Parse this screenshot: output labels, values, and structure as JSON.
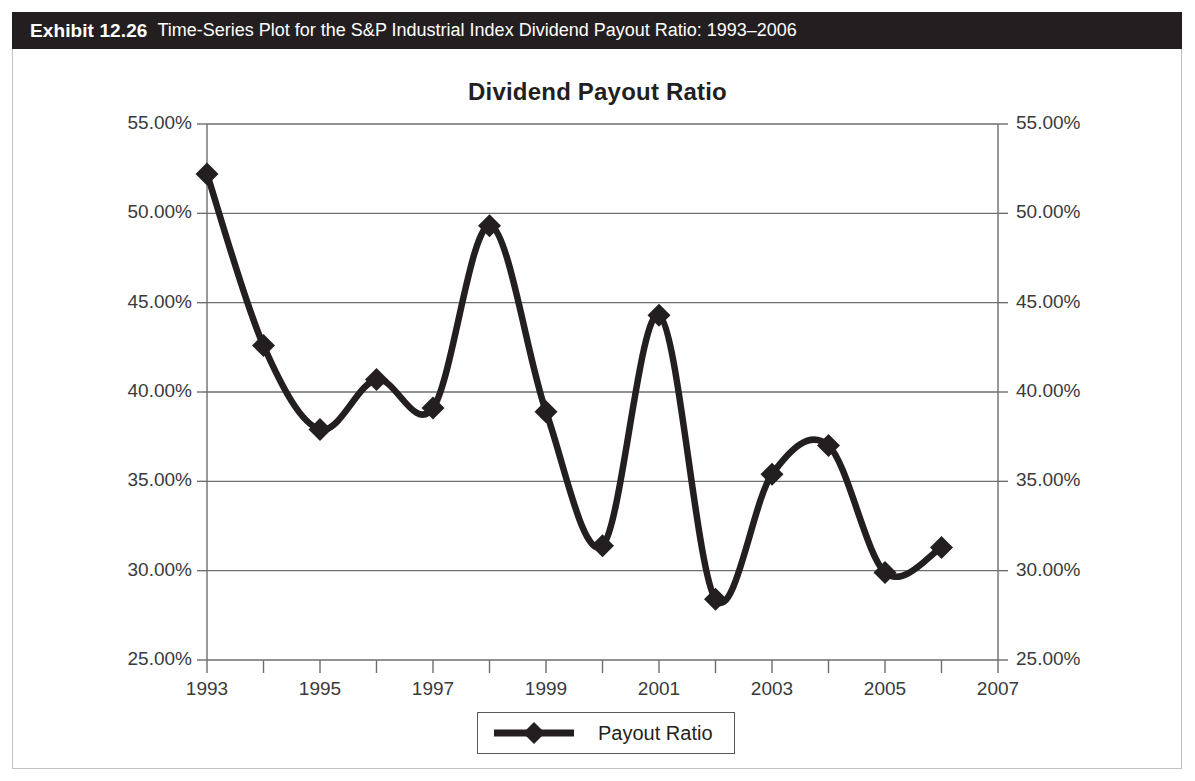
{
  "exhibit": {
    "label": "Exhibit 12.26",
    "caption": "Time-Series Plot for the S&P Industrial Index Dividend Payout Ratio: 1993–2006"
  },
  "chart_data": {
    "type": "line",
    "title": "Dividend Payout Ratio",
    "xlabel": "",
    "ylabel": "",
    "x": [
      1993,
      1994,
      1995,
      1996,
      1997,
      1998,
      1999,
      2000,
      2001,
      2002,
      2003,
      2004,
      2005,
      2006
    ],
    "values": [
      52.2,
      42.6,
      37.9,
      40.7,
      39.1,
      49.3,
      38.9,
      31.4,
      44.3,
      28.4,
      35.4,
      37.0,
      29.9,
      31.3
    ],
    "series": [
      {
        "name": "Payout Ratio",
        "values": [
          52.2,
          42.6,
          37.9,
          40.7,
          39.1,
          49.3,
          38.9,
          31.4,
          44.3,
          28.4,
          35.4,
          37.0,
          29.9,
          31.3
        ]
      }
    ],
    "xlim": [
      1993,
      2007
    ],
    "ylim": [
      25,
      55
    ],
    "x_tick_labels": [
      "1993",
      "1995",
      "1997",
      "1999",
      "2001",
      "2003",
      "2005",
      "2007"
    ],
    "x_tick_values": [
      1993,
      1995,
      1997,
      1999,
      2001,
      2003,
      2005,
      2007
    ],
    "x_minor_ticks": [
      1994,
      1996,
      1998,
      2000,
      2002,
      2004,
      2006
    ],
    "y_tick_labels": [
      "55.00%",
      "50.00%",
      "45.00%",
      "40.00%",
      "35.00%",
      "30.00%",
      "25.00%"
    ],
    "y_tick_values": [
      55,
      50,
      45,
      40,
      35,
      30,
      25
    ],
    "y_axis_right_labels": [
      "55.00%",
      "50.00%",
      "45.00%",
      "40.00%",
      "35.00%",
      "30.00%",
      "25.00%"
    ],
    "grid": "horizontal",
    "legend_position": "bottom-center",
    "legend": [
      {
        "label": "Payout Ratio",
        "marker": "diamond",
        "color": "#231f20"
      }
    ],
    "line_color": "#231f20",
    "grid_color": "#6d6e71",
    "units": "percent"
  }
}
